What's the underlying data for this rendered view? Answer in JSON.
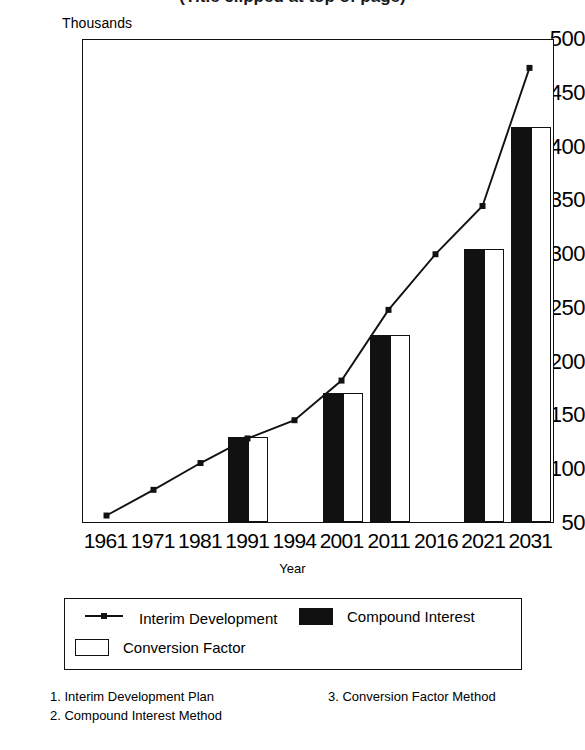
{
  "title": "(Title clipped at top of page)",
  "axis": {
    "y_unit_label": "Thousands",
    "x_title": "Year",
    "y_ticks": [
      "500",
      "450",
      "400",
      "350",
      "300",
      "250",
      "200",
      "150",
      "100",
      "50"
    ]
  },
  "legend": {
    "items": [
      {
        "label": "Interim Development",
        "marker": "line-marker-swatch"
      },
      {
        "label": "Compound Interest",
        "marker": "solid-bar-swatch"
      },
      {
        "label": "Conversion Factor",
        "marker": "hollow-bar-swatch"
      }
    ]
  },
  "footnotes": {
    "left": [
      "1. Interim Development Plan",
      "2. Compound Interest Method"
    ],
    "right": [
      "3. Conversion Factor Method"
    ]
  },
  "chart_data": {
    "type": "bar",
    "title": "(Title clipped at top of page)",
    "xlabel": "Year",
    "ylabel": "Thousands",
    "ylim": [
      50,
      500
    ],
    "ytick_step": 50,
    "grid": false,
    "legend_position": "below-plot",
    "categories": [
      "1961",
      "1971",
      "1981",
      "1991",
      "1994",
      "2001",
      "2011",
      "2016",
      "2021",
      "2031"
    ],
    "series": [
      {
        "name": "Interim Development",
        "type": "line",
        "marker": "square",
        "color": "#111111",
        "values": [
          56,
          80,
          105,
          128,
          145,
          182,
          248,
          300,
          345,
          474
        ]
      },
      {
        "name": "Compound Interest",
        "type": "bar",
        "fill": "solid",
        "color": "#111111",
        "values": [
          null,
          null,
          null,
          129,
          null,
          170,
          224,
          null,
          304,
          417
        ]
      },
      {
        "name": "Conversion Factor",
        "type": "bar",
        "fill": "hollow",
        "color": "#ffffff",
        "values": [
          null,
          null,
          null,
          129,
          null,
          170,
          224,
          null,
          304,
          417
        ]
      }
    ]
  }
}
